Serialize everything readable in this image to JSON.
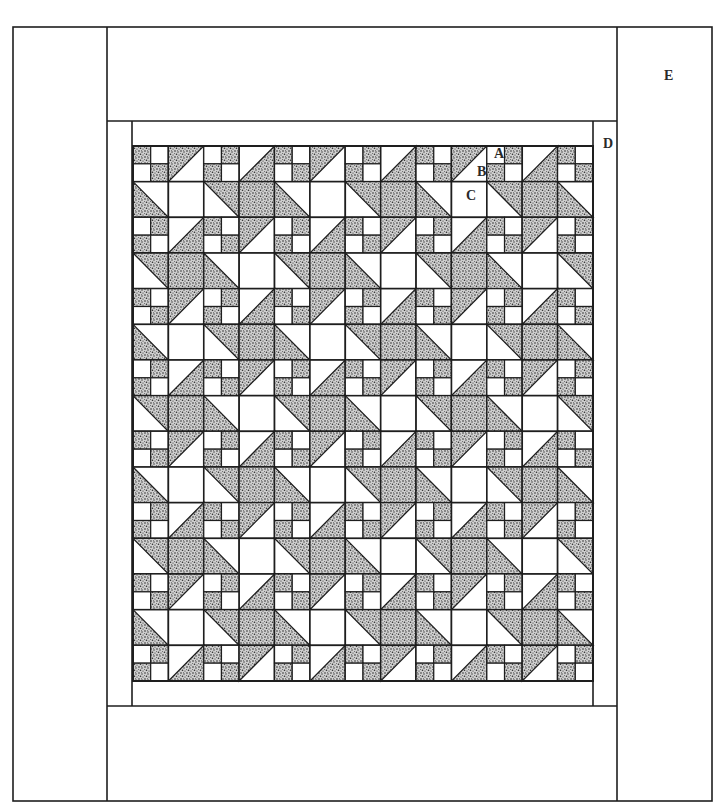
{
  "diagram": {
    "labels": {
      "A": "A",
      "B": "B",
      "C": "C",
      "D": "D",
      "E": "E"
    },
    "colors": {
      "line": "#1e1e1e",
      "background": "#ffffff",
      "stipple_dark": "#2b2b2b",
      "stipple_base": "#d6d6d6"
    },
    "grid": {
      "columns": 13,
      "rows": 15,
      "x0": 133,
      "y0": 146,
      "x1": 593,
      "y1": 681
    },
    "cell_legend": {
      "F1": "four-patch, shaded top-left and bottom-right",
      "F2": "four-patch, shaded top-right and bottom-left",
      "HTL": "half-square triangle '/', shaded upper-left",
      "HBR": "half-square triangle '/', shaded lower-right",
      "DBL": "half-square triangle '\\', shaded lower-left",
      "DTR": "half-square triangle '\\', shaded upper-right",
      "S": "solid shaded square",
      "W": "plain white square"
    },
    "row_patterns": [
      [
        "F1",
        "HTL",
        "F2",
        "HBR",
        "F1",
        "HTL",
        "F2",
        "HBR",
        "F1",
        "HTL",
        "F2",
        "HBR",
        "F1"
      ],
      [
        "DBL",
        "W",
        "DTR",
        "S",
        "DBL",
        "W",
        "DTR",
        "S",
        "DBL",
        "W",
        "DTR",
        "S",
        "DBL"
      ],
      [
        "F2",
        "HBR",
        "F1",
        "HTL",
        "F2",
        "HBR",
        "F1",
        "HTL",
        "F2",
        "HBR",
        "F1",
        "HTL",
        "F2"
      ],
      [
        "DTR",
        "S",
        "DBL",
        "W",
        "DTR",
        "S",
        "DBL",
        "W",
        "DTR",
        "S",
        "DBL",
        "W",
        "DTR"
      ]
    ],
    "borders": {
      "outer": {
        "x": 13,
        "y": 27,
        "w": 699,
        "h": 774
      },
      "left_strip_x": 107,
      "right_strip_x": 617,
      "top_strip_y": 121,
      "bottom_strip_y": 706,
      "inner_left_x": 132,
      "inner_right_x": 593
    },
    "label_positions": {
      "A": {
        "x": 494,
        "y": 158
      },
      "B": {
        "x": 477,
        "y": 176
      },
      "C": {
        "x": 466,
        "y": 200
      },
      "D": {
        "x": 603,
        "y": 148
      },
      "E": {
        "x": 664,
        "y": 80
      }
    }
  }
}
